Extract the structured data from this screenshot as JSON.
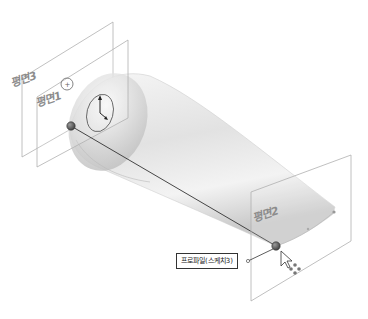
{
  "scene": {
    "title": "Loft profile selection",
    "planes": [
      {
        "id": "plane3",
        "label": "평면3"
      },
      {
        "id": "plane1",
        "label": "평면1"
      },
      {
        "id": "plane2",
        "label": "평면2"
      }
    ],
    "callout": {
      "label": "프로파일(스케치3)"
    },
    "colors": {
      "plane_edge": "#a8a8a8",
      "body_light": "#f4f4f4",
      "body_dark": "#b9b9b9",
      "guide_line": "#333333",
      "point": "#555555"
    }
  }
}
